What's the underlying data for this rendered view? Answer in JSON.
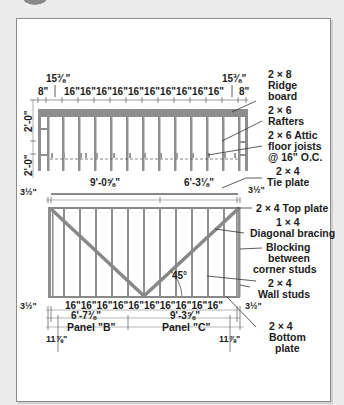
{
  "diagram": {
    "attic": {
      "top_dims": {
        "left_offset": "15⅜\"",
        "right_offset": "15⅜\"",
        "left_end": "8\"",
        "right_end": "8\"",
        "spacing_label": "16\"16\"16\"16\"16\"16\"16\"16\"16\"16\""
      },
      "side_dims": {
        "upper": "2'-0\"",
        "lower": "2'-0\""
      },
      "callouts": {
        "ridge_size": "2 × 8",
        "ridge_name1": "Ridge",
        "ridge_name2": "board",
        "rafter_size": "2 × 6",
        "rafter_name": "Rafters",
        "joist_line1": "2 × 6 Attic",
        "joist_line2": "floor joists",
        "joist_line3": "@ 16\" O.C."
      }
    },
    "tie_plate": {
      "left_len": "9'-0⅝\"",
      "right_len": "6'-3⅛\"",
      "left_offset": "3½\"",
      "right_offset": "3½\"",
      "size": "2 × 4",
      "name": "Tie plate"
    },
    "wall": {
      "callouts": {
        "top_plate": "2 × 4 Top plate",
        "bracing_size": "1 × 4",
        "bracing_name": "Diagonal bracing",
        "blocking1": "Blocking",
        "blocking2": "between",
        "blocking3": "corner studs",
        "studs_size": "2 × 4",
        "studs_name": "Wall studs",
        "bottom_size": "2 × 4",
        "bottom_name1": "Bottom",
        "bottom_name2": "plate"
      },
      "angle": "45°",
      "bottom_dims": {
        "left_offset": "3½\"",
        "right_offset": "3½\"",
        "spacing_label": "16\"16\"16\"16\"16\"16\"16\"16\"16\"16\"",
        "panel_b_len": "6'-7⅜\"",
        "panel_c_len": "9'-3⅝\"",
        "panel_b": "Panel \"B\"",
        "panel_c": "Panel \"C\"",
        "left_end": "11⅞\"",
        "right_end": "11⅞\""
      }
    }
  }
}
